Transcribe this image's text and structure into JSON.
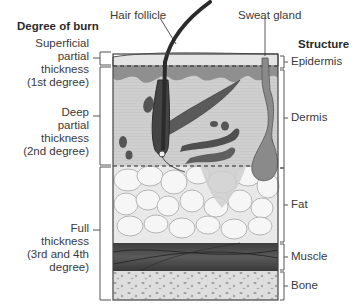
{
  "headings": {
    "left": "Degree of burn",
    "right": "Structure"
  },
  "callouts": {
    "hair_follicle": "Hair follicle",
    "sweat_gland": "Sweat gland"
  },
  "burn_degrees": [
    {
      "lines": [
        "Superficial",
        "partial",
        "thickness",
        "(1st degree)"
      ]
    },
    {
      "lines": [
        "Deep",
        "partial",
        "thickness",
        "(2nd degree)"
      ]
    },
    {
      "lines": [
        "Full",
        "thickness",
        "(3rd and 4th",
        "degree)"
      ]
    }
  ],
  "structures": [
    {
      "label": "Epidermis"
    },
    {
      "label": "Dermis"
    },
    {
      "label": "Fat"
    },
    {
      "label": "Muscle"
    },
    {
      "label": "Bone"
    }
  ],
  "colors": {
    "epidermis_top": "#e6e6e6",
    "epidermis_dark": "#8a8a8a",
    "dermis": "#cfcfcf",
    "fat": "#ececec",
    "muscle": "#4d4d4d",
    "bone": "#dcdcdc",
    "follicle": "#3a3a3a",
    "outline": "#4a4a4a"
  }
}
